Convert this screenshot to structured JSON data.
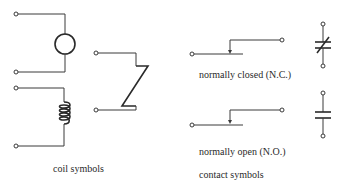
{
  "diagram": {
    "groups": [
      {
        "id": "coil",
        "caption": "coil symbols",
        "symbols": [
          {
            "name": "circle-coil",
            "icon": "circle-coil-icon"
          },
          {
            "name": "helix-coil",
            "icon": "inductor-coil-icon"
          },
          {
            "name": "zigzag-coil",
            "icon": "zigzag-coil-icon"
          }
        ]
      },
      {
        "id": "contact",
        "caption": "contact symbols",
        "symbols": [
          {
            "name": "normally-closed",
            "label": "normally closed (N.C.)",
            "icon": "nc-contact-icon",
            "alt_icon": "nc-contact-ladder-icon"
          },
          {
            "name": "normally-open",
            "label": "normally open (N.O.)",
            "icon": "no-contact-icon",
            "alt_icon": "no-contact-ladder-icon"
          }
        ]
      }
    ],
    "colors": {
      "line": "#3a3a3a",
      "text": "#2a2a2a",
      "background": "#ffffff"
    }
  }
}
